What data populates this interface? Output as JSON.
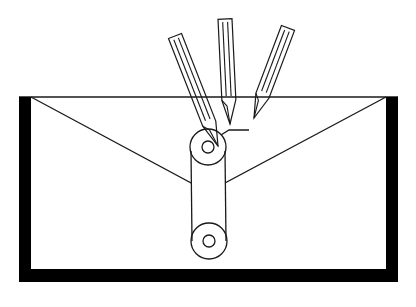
{
  "diagram": {
    "colors": {
      "stroke": "#1a1a1a",
      "background": "#ffffff",
      "frame": "#000000"
    },
    "frame": {
      "top_y": 97,
      "left_x": 19,
      "right_x": 398,
      "bottom_y": 282,
      "left_bar_width": 12,
      "right_bar_width": 12,
      "bottom_bar_height": 13
    },
    "flap": {
      "left": [
        31,
        97
      ],
      "apex": [
        208,
        192
      ],
      "right": [
        386,
        97
      ]
    },
    "pencils": [
      {
        "name": "left",
        "tail": [
          175,
          36
        ],
        "tip": [
          218,
          146
        ],
        "width": 14
      },
      {
        "name": "center",
        "tail": [
          225,
          19
        ],
        "tip": [
          230,
          124
        ],
        "width": 14
      },
      {
        "name": "right",
        "tail": [
          288,
          28
        ],
        "tip": [
          254,
          118
        ],
        "width": 14
      }
    ],
    "pulleys": [
      {
        "name": "upper",
        "cx": 208,
        "cy": 147,
        "r_outer": 18,
        "r_inner": 6
      },
      {
        "name": "lower",
        "cx": 209,
        "cy": 241,
        "r_outer": 18,
        "r_inner": 6
      }
    ],
    "connector": {
      "points": [
        [
          221,
          135
        ],
        [
          229,
          130
        ],
        [
          249,
          130
        ]
      ]
    }
  }
}
